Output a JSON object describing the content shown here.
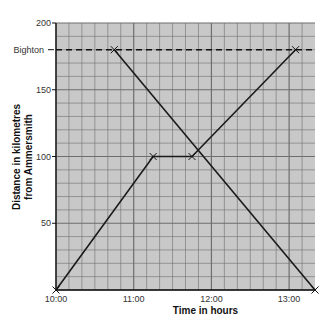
{
  "chart_data": {
    "type": "line",
    "title": "",
    "xlabel": "Time in hours",
    "ylabel_lines": [
      "Distance in kilometres",
      "from Ammersmith"
    ],
    "ylabel": "Distance in kilometres from Ammersmith",
    "x_ticks": [
      "10:00",
      "11:00",
      "12:00",
      "13:00"
    ],
    "y_ticks": [
      50,
      100,
      150,
      200
    ],
    "xlim_hours": [
      10.0,
      13.333
    ],
    "ylim": [
      0,
      200
    ],
    "grid": true,
    "grid_minor_x_minutes": 10,
    "grid_minor_y_km": 10,
    "reference_lines": [
      {
        "label": "Bighton",
        "y": 180,
        "style": "dashed"
      }
    ],
    "series": [
      {
        "name": "Ammersmith to Bighton",
        "points": [
          {
            "time": "10:00",
            "hours": 10.0,
            "distance": 0
          },
          {
            "time": "11:15",
            "hours": 11.25,
            "distance": 100
          },
          {
            "time": "11:45",
            "hours": 11.75,
            "distance": 100
          },
          {
            "time": "13:05",
            "hours": 13.083,
            "distance": 180
          }
        ]
      },
      {
        "name": "Bighton to Ammersmith",
        "points": [
          {
            "time": "10:45",
            "hours": 10.75,
            "distance": 180
          },
          {
            "time": "13:20",
            "hours": 13.333,
            "distance": 0
          }
        ]
      }
    ],
    "colors": {
      "plot_background": "#c8c8c8",
      "grid_line": "#6e6e6e",
      "series_line": "#1a1a1a"
    }
  }
}
